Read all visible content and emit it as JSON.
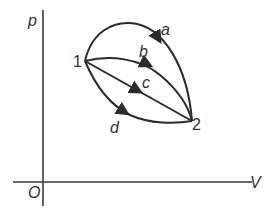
{
  "diagram": {
    "title": "",
    "axes": {
      "y_label": "p",
      "x_label": "V",
      "origin_label": "O"
    },
    "points": [
      {
        "id": "1",
        "label": "1"
      },
      {
        "id": "2",
        "label": "2"
      }
    ],
    "paths": [
      {
        "id": "a",
        "label": "a",
        "from": "1",
        "to": "2",
        "shape": "upper large arc"
      },
      {
        "id": "b",
        "label": "b",
        "from": "1",
        "to": "2",
        "shape": "slight upward arc"
      },
      {
        "id": "c",
        "label": "c",
        "from": "1",
        "to": "2",
        "shape": "straight line"
      },
      {
        "id": "d",
        "label": "d",
        "from": "1",
        "to": "2",
        "shape": "lower arc"
      }
    ],
    "colors": {
      "stroke": "#2b2b2b",
      "text": "#333333",
      "background": "#ffffff"
    }
  }
}
